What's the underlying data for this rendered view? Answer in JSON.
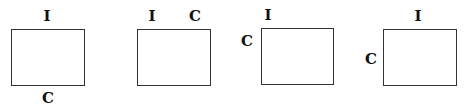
{
  "diagram": {
    "panels": [
      {
        "id": 1,
        "labels": [
          {
            "text": "I",
            "position": "top-center"
          },
          {
            "text": "C",
            "position": "bottom-center"
          }
        ]
      },
      {
        "id": 2,
        "labels": [
          {
            "text": "I",
            "position": "top-left"
          },
          {
            "text": "C",
            "position": "top-right"
          }
        ]
      },
      {
        "id": 3,
        "labels": [
          {
            "text": "I",
            "position": "top-left"
          },
          {
            "text": "C",
            "position": "left-upper"
          }
        ]
      },
      {
        "id": 4,
        "labels": [
          {
            "text": "I",
            "position": "top-center"
          },
          {
            "text": "C",
            "position": "left-middle"
          }
        ]
      }
    ]
  }
}
